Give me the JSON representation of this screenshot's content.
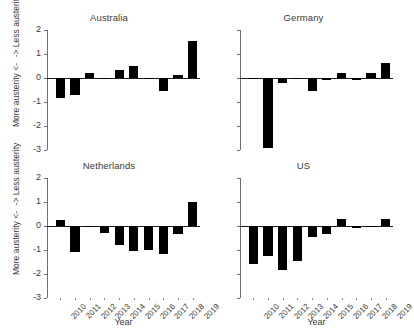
{
  "figure": {
    "y_axis_label_upper": "-> Less austerity",
    "y_axis_label_lower": "More austerity <-",
    "x_axis_title": "Year",
    "bar_color": "#000000",
    "axis_color": "#6e6e6e",
    "text_color": "#3b3b3b"
  },
  "chart_data": {
    "type": "bar",
    "title": "",
    "xlabel": "Year",
    "ylabel": "More austerity <-  ->  Less austerity",
    "ylim": [
      -3,
      2
    ],
    "yticks": [
      2,
      1,
      0,
      -1,
      -2,
      -3
    ],
    "ytick_labels": [
      "2",
      "1",
      "0",
      "-1",
      "-2",
      "-3"
    ],
    "grid": false,
    "legend": "none",
    "categories": [
      "2010",
      "2011",
      "2012",
      "2013",
      "2014",
      "2015",
      "2016",
      "2017",
      "2018",
      "2019"
    ],
    "panels": [
      {
        "title": "Australia",
        "values": [
          -0.85,
          -0.7,
          0.2,
          -0.05,
          0.32,
          0.5,
          -0.02,
          -0.55,
          0.12,
          1.55
        ]
      },
      {
        "title": "Germany",
        "values": [
          -0.03,
          -2.9,
          -0.22,
          -0.03,
          -0.55,
          -0.08,
          0.2,
          -0.1,
          0.2,
          0.62
        ]
      },
      {
        "title": "Netherlands",
        "values": [
          0.25,
          -1.1,
          -0.02,
          -0.28,
          -0.8,
          -1.05,
          -1.0,
          -1.15,
          -0.35,
          1.0
        ]
      },
      {
        "title": "US",
        "values": [
          -1.6,
          -1.25,
          -1.85,
          -1.45,
          -0.45,
          -0.35,
          0.3,
          -0.1,
          -0.05,
          0.3
        ]
      }
    ]
  }
}
